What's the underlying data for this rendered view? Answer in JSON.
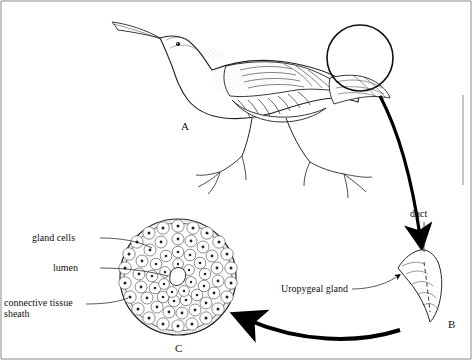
{
  "figure": {
    "title_absent": true,
    "panels": [
      {
        "id": "A",
        "letter": "A",
        "caption": "bird-lateral-view"
      },
      {
        "id": "B",
        "letter": "B",
        "caption": "uropygial-gland-closeup"
      },
      {
        "id": "C",
        "letter": "C",
        "caption": "gland-cross-section"
      }
    ]
  },
  "labels": {
    "duct": "duct",
    "uropygeal_gland": "Uropygeal gland",
    "gland_cells": "gland cells",
    "lumen": "lumen",
    "connective_tissue_sheath": "connective tissue\nsheath"
  },
  "colors": {
    "ink": "#111111",
    "paper": "#ffffff",
    "frame": "#8a8a8a",
    "arrow": "#000000"
  },
  "icons": {
    "circle_highlight": "circle-highlight-icon",
    "arrow_a_to_b": "curved-arrow-icon",
    "arrow_b_to_c": "curved-arrow-icon",
    "leader_line": "leader-line-icon"
  }
}
